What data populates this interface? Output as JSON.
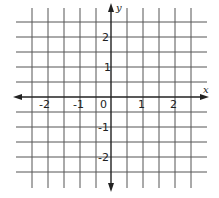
{
  "diagram": {
    "type": "coordinate-plane",
    "axes": {
      "x_label": "x",
      "y_label": "y"
    },
    "grid": {
      "columns": 10,
      "rows": 10,
      "x_range": [
        -5,
        5
      ],
      "y_range": [
        -5,
        5
      ]
    },
    "x_ticks": [
      {
        "value": -2,
        "label": "-2"
      },
      {
        "value": -1,
        "label": "-1"
      },
      {
        "value": 0,
        "label": "0"
      },
      {
        "value": 1,
        "label": "1"
      },
      {
        "value": 2,
        "label": "2"
      }
    ],
    "y_ticks": [
      {
        "value": 2,
        "label": "2"
      },
      {
        "value": 1,
        "label": "1"
      },
      {
        "value": -1,
        "label": "-1"
      },
      {
        "value": -2,
        "label": "-2"
      }
    ],
    "colors": {
      "grid": "#555555",
      "axis": "#222222",
      "background": "#ffffff"
    }
  }
}
